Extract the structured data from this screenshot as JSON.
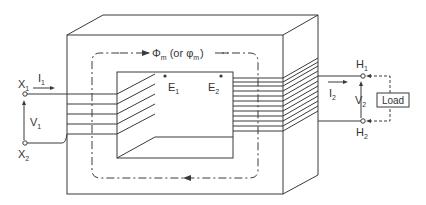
{
  "diagram": {
    "type": "single-phase transformer",
    "flux_label": "Φm (or φm)",
    "flux_symbol": "Φ",
    "flux_sub": "m",
    "flux_alt_prefix": "(or φ",
    "flux_alt_sub": "m",
    "flux_alt_suffix": ")",
    "primary": {
      "terminal_top": {
        "letter": "X",
        "sub": "1"
      },
      "terminal_bottom": {
        "letter": "X",
        "sub": "2"
      },
      "current": {
        "letter": "I",
        "sub": "1"
      },
      "voltage": {
        "letter": "V",
        "sub": "1"
      },
      "emf": {
        "letter": "E",
        "sub": "1"
      },
      "turns": 5
    },
    "secondary": {
      "terminal_top": {
        "letter": "H",
        "sub": "1"
      },
      "terminal_bottom": {
        "letter": "H",
        "sub": "2"
      },
      "current": {
        "letter": "I",
        "sub": "2"
      },
      "voltage": {
        "letter": "V",
        "sub": "2"
      },
      "emf": {
        "letter": "E",
        "sub": "2"
      },
      "turns": 12
    },
    "load_label": "Load",
    "colors": {
      "line": "#3a3a3a",
      "background": "#ffffff"
    }
  }
}
